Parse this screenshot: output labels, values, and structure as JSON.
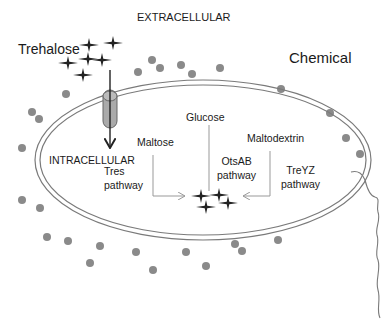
{
  "diagram": {
    "type": "cell-pathway-diagram",
    "labels": {
      "extracellular": "EXTRACELLULAR",
      "trehalose": "Trehalose",
      "chemical": "Chemical",
      "glucose": "Glucose",
      "maltose": "Maltose",
      "maltodextrin": "Maltodextrin",
      "intracellular": "INTRACELLULAR",
      "tres_line1": "Tres",
      "tres_line2": "pathway",
      "otsab_line1": "OtsAB",
      "otsab_line2": "pathway",
      "treyz_line1": "TreYZ",
      "treyz_line2": "pathway"
    },
    "nodes": [
      {
        "id": "trehalose-ext",
        "label": "Trehalose",
        "location": "extracellular"
      },
      {
        "id": "transporter",
        "label": "",
        "location": "membrane"
      },
      {
        "id": "maltose",
        "label": "Maltose",
        "location": "intracellular"
      },
      {
        "id": "glucose",
        "label": "Glucose",
        "location": "intracellular"
      },
      {
        "id": "maltodextrin",
        "label": "Maltodextrin",
        "location": "intracellular"
      },
      {
        "id": "trehalose-int",
        "label": "",
        "location": "intracellular"
      }
    ],
    "edges": [
      {
        "from": "trehalose-ext",
        "to": "transporter",
        "label": ""
      },
      {
        "from": "maltose",
        "to": "trehalose-int",
        "label": "Tres pathway"
      },
      {
        "from": "glucose",
        "to": "trehalose-int",
        "label": "OtsAB pathway"
      },
      {
        "from": "maltodextrin",
        "to": "trehalose-int",
        "label": "TreYZ pathway"
      }
    ],
    "colors": {
      "membrane": "#7a7a7a",
      "dots": "#8a8a8a",
      "text": "#1a1a1a",
      "stars": "#222222",
      "arrows": "#999999"
    }
  }
}
